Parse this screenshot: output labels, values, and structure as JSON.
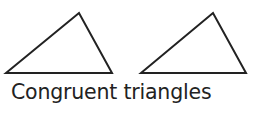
{
  "diagram": {
    "caption": "Congruent triangles",
    "shapes": [
      {
        "name": "triangle-left",
        "type": "triangle",
        "label": ""
      },
      {
        "name": "triangle-right",
        "type": "triangle",
        "label": ""
      }
    ],
    "colors": {
      "stroke": "#222222",
      "text": "#222222",
      "background": "#ffffff"
    }
  }
}
